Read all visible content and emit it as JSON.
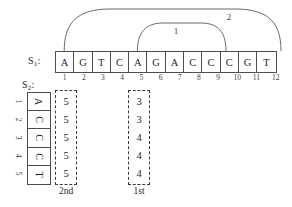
{
  "figure": {
    "type": "sequence-alignment-diagram",
    "background": "#ffffff",
    "line_color": "#555a5e"
  },
  "s1": {
    "label": "S",
    "label_sub": "1",
    "label_colon": ":",
    "letters": [
      "A",
      "G",
      "T",
      "C",
      "A",
      "G",
      "A",
      "C",
      "C",
      "C",
      "G",
      "T"
    ],
    "indices": [
      "1",
      "2",
      "3",
      "4",
      "5",
      "6",
      "7",
      "8",
      "9",
      "10",
      "11",
      "12"
    ]
  },
  "s2": {
    "label": "S",
    "label_sub": "2",
    "label_colon": ":",
    "letters": [
      "A",
      "C",
      "C",
      "C",
      "T"
    ],
    "indices": [
      "1",
      "2",
      "3",
      "4",
      "5"
    ]
  },
  "arcs": [
    {
      "name": "arc-inner",
      "label": "1",
      "start_position": "5",
      "end_position": "9"
    },
    {
      "name": "arc-outer",
      "label": "2",
      "start_position": "1",
      "end_position": "12"
    }
  ],
  "dp_columns": [
    {
      "name": "column-2nd",
      "caption": "2nd",
      "aligned_s1_position": "1",
      "values": [
        "5",
        "5",
        "5",
        "5",
        "5"
      ]
    },
    {
      "name": "column-1st",
      "caption": "1st",
      "aligned_s1_position": "5",
      "values": [
        "3",
        "3",
        "4",
        "4",
        "4"
      ]
    }
  ],
  "chart_data": {
    "type": "table",
    "title": "",
    "xlabel": "",
    "ylabel": "",
    "categories": [
      "1",
      "2",
      "3",
      "4",
      "5"
    ],
    "series": [
      {
        "name": "2nd",
        "values": [
          5,
          5,
          5,
          5,
          5
        ]
      },
      {
        "name": "1st",
        "values": [
          3,
          3,
          4,
          4,
          4
        ]
      }
    ],
    "annotations": [
      {
        "label": "1",
        "span": [
          5,
          9
        ]
      },
      {
        "label": "2",
        "span": [
          1,
          12
        ]
      }
    ]
  }
}
